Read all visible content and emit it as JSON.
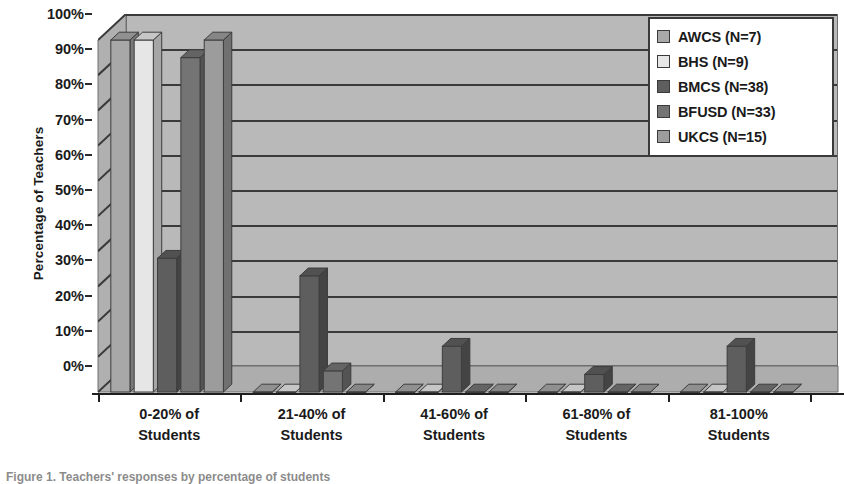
{
  "chart_data": {
    "type": "bar",
    "title": "",
    "xlabel": "",
    "ylabel": "Percentage of Teachers",
    "ylim": [
      0,
      100
    ],
    "ytick_labels": [
      "100%",
      "90%",
      "80%",
      "70%",
      "60%",
      "50%",
      "40%",
      "30%",
      "20%",
      "10%",
      "0%"
    ],
    "ytick_values": [
      100,
      90,
      80,
      70,
      60,
      50,
      40,
      30,
      20,
      10,
      0
    ],
    "grid": true,
    "legend_position": "top-right",
    "style": "3d-clustered-column",
    "categories": [
      "0-20% of Students",
      "21-40% of Students",
      "41-60% of Students",
      "61-80% of Students",
      "81-100% Students"
    ],
    "category_lines": [
      [
        "0-20% of",
        "Students"
      ],
      [
        "21-40% of",
        "Students"
      ],
      [
        "41-60% of",
        "Students"
      ],
      [
        "61-80% of",
        "Students"
      ],
      [
        "81-100%",
        "Students"
      ]
    ],
    "series": [
      {
        "name": "AWCS (N=7)",
        "color": "#a8a8a8",
        "values": [
          100,
          0,
          0,
          0,
          0
        ]
      },
      {
        "name": "BHS (N=9)",
        "color": "#e6e6e6",
        "values": [
          100,
          0,
          0,
          0,
          0
        ]
      },
      {
        "name": "BMCS (N=38)",
        "color": "#5e5e5e",
        "values": [
          38,
          33,
          13,
          5,
          13
        ]
      },
      {
        "name": "BFUSD (N=33)",
        "color": "#747474",
        "values": [
          95,
          6,
          0,
          0,
          0
        ]
      },
      {
        "name": "UKCS (N=15)",
        "color": "#9c9c9c",
        "values": [
          100,
          0,
          0,
          0,
          0
        ]
      }
    ]
  },
  "legend": {
    "entries": [
      {
        "label": "AWCS (N=7)"
      },
      {
        "label": "BHS (N=9)"
      },
      {
        "label": "BMCS (N=38)"
      },
      {
        "label": "BFUSD (N=33)"
      },
      {
        "label": "UKCS (N=15)"
      }
    ]
  },
  "colors": {
    "plot_background": "#b9b9b9",
    "gridline": "#3a3a3a",
    "axis": "#1f1f1f",
    "text": "#1a1a1a",
    "legend_background": "#ffffff",
    "legend_border": "#3a3a3a"
  },
  "caption": {
    "text": "Figure 1. Teachers' responses by percentage of students"
  }
}
